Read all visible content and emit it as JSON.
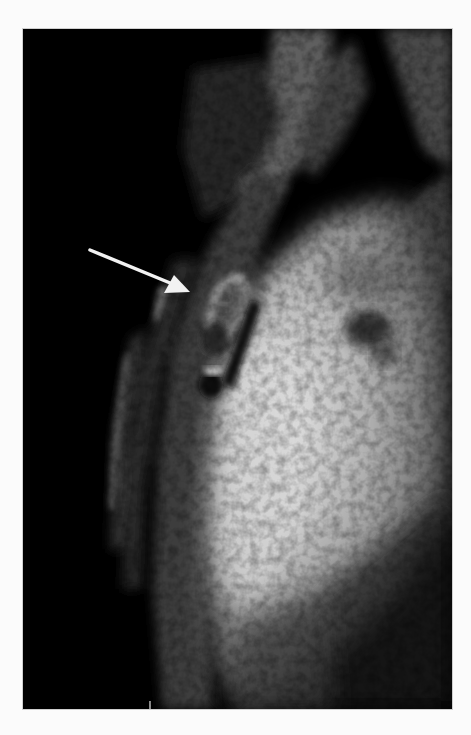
{
  "figure": {
    "type": "grayscale MRI scan",
    "background_color": "#fbfbfb",
    "image_background": "#000000",
    "annotations": [
      {
        "kind": "arrow",
        "color": "#f2f2f2",
        "from": [
          90,
          250
        ],
        "to": [
          190,
          292
        ],
        "points_at": "oval bright-rimmed lesion with dark nodular interior"
      }
    ],
    "regions": [
      {
        "name": "large-bright-mass",
        "tone": "bright gray"
      },
      {
        "name": "oval-lesion",
        "tone": "bright rim"
      },
      {
        "name": "left-soft-tissue-band",
        "tone": "dark gray"
      },
      {
        "name": "upper-structures",
        "tone": "dim gray"
      }
    ]
  }
}
